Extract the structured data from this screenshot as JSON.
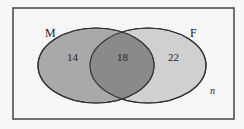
{
  "diagram": {
    "type": "venn",
    "universe_label": "n",
    "sets": [
      {
        "name": "M",
        "only_value": "14",
        "fill": "#a9a9a9"
      },
      {
        "name": "F",
        "only_value": "22",
        "fill": "#d2d2d2"
      }
    ],
    "intersection_value": "18",
    "intersection_fill": "#888888",
    "border_color": "#333333"
  }
}
